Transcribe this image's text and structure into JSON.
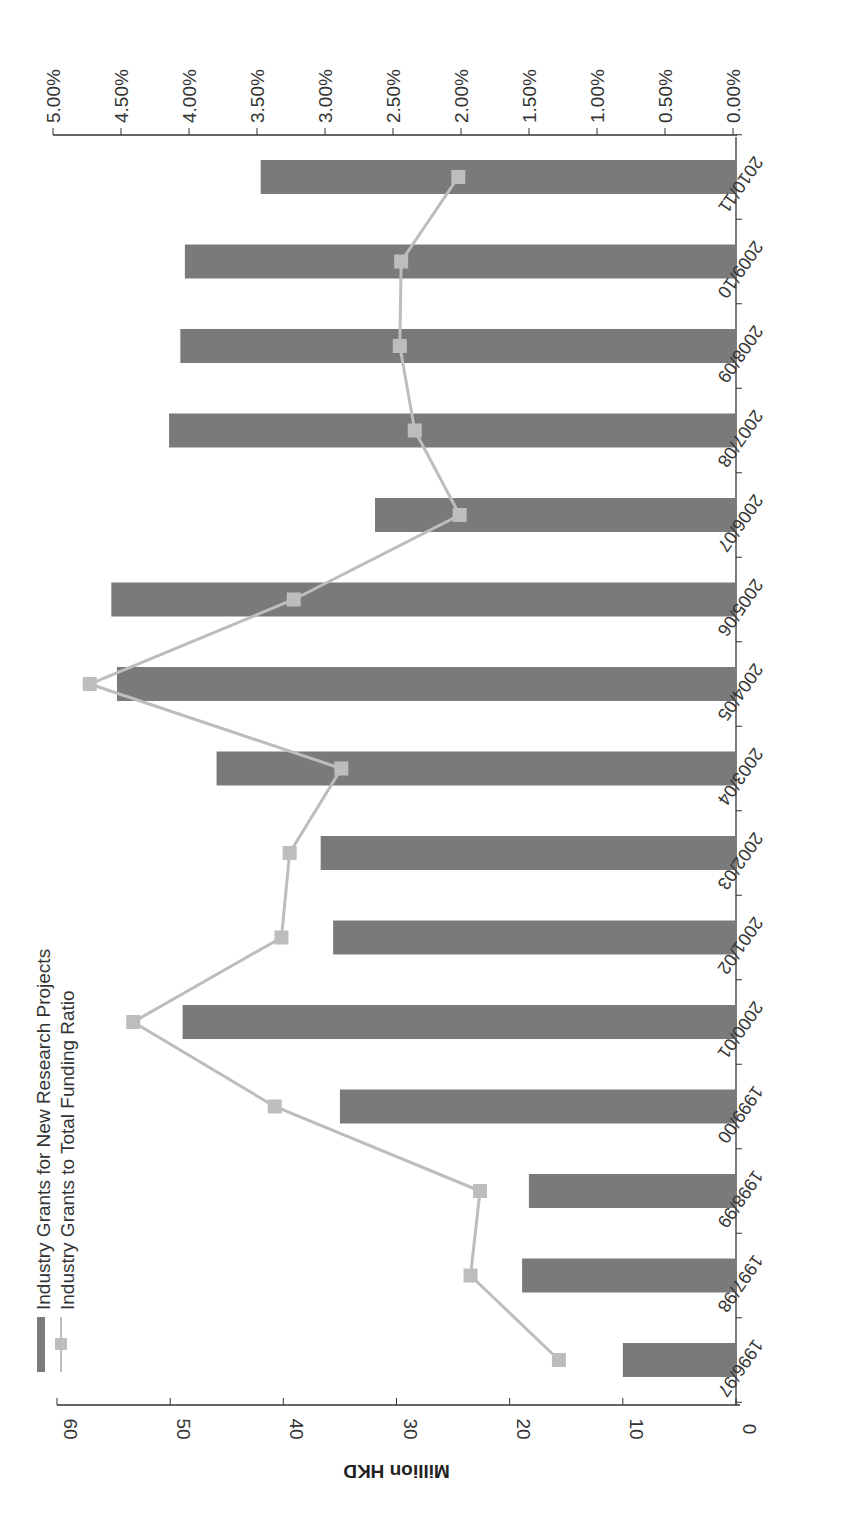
{
  "chart_data": {
    "type": "bar",
    "orientation": "rotated-90",
    "title": "",
    "xlabel": "",
    "ylabel": "Million HKD",
    "y2label": "",
    "categories": [
      "1996/97",
      "1997/98",
      "1998/99",
      "1999/00",
      "2000/01",
      "2001/02",
      "2002/03",
      "2003/04",
      "2004/05",
      "2005/06",
      "2006/07",
      "2007/08",
      "2008/09",
      "2009/10",
      "2010/11"
    ],
    "series": [
      {
        "name": "Industry Grants for New Research Projects",
        "type": "bar",
        "axis": "left",
        "color": "#7a7a7a",
        "values": [
          10.0,
          18.9,
          18.3,
          35.0,
          48.9,
          35.6,
          36.7,
          45.9,
          54.7,
          55.2,
          31.9,
          50.1,
          49.1,
          48.7,
          42.0
        ]
      },
      {
        "name": "Industry Grants to Total Funding Ratio",
        "type": "line",
        "axis": "right",
        "marker": "square",
        "color": "#bdbdbd",
        "values": [
          1.28,
          1.93,
          1.86,
          3.37,
          4.41,
          3.32,
          3.26,
          2.88,
          4.73,
          3.23,
          2.01,
          2.34,
          2.45,
          2.44,
          2.02
        ]
      }
    ],
    "ylim": [
      0,
      60
    ],
    "yticks": [
      "0",
      "10",
      "20",
      "30",
      "40",
      "50",
      "60"
    ],
    "y2lim": [
      0,
      5
    ],
    "y2ticks": [
      "0.00%",
      "0.50%",
      "1.00%",
      "1.50%",
      "2.00%",
      "2.50%",
      "3.00%",
      "3.50%",
      "4.00%",
      "4.50%",
      "5.00%"
    ],
    "grid": false,
    "legend_position": "upper-left (inside plot)"
  },
  "legend": {
    "items": [
      {
        "label": "Industry Grants for New Research Projects"
      },
      {
        "label": "Industry Grants to Total Funding Ratio"
      }
    ]
  },
  "axes": {
    "left_title": "Million HKD"
  },
  "colors": {
    "bar": "#7a7a7a",
    "line": "#bdbdbd",
    "axis": "#333333"
  }
}
